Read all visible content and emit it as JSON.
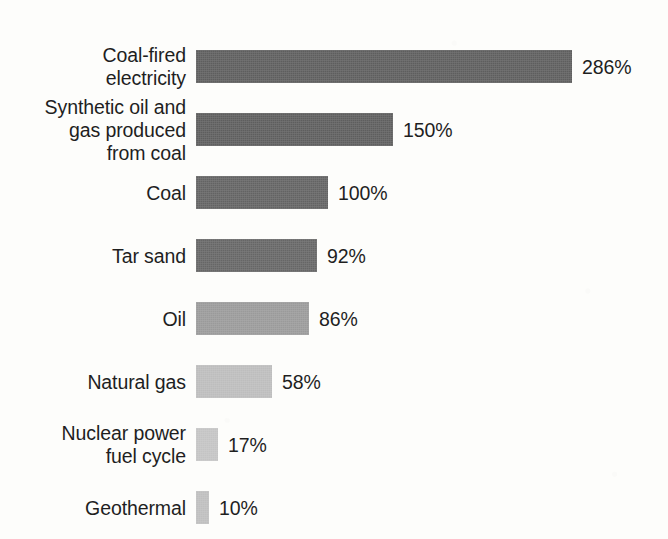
{
  "chart_data": {
    "type": "bar",
    "orientation": "horizontal",
    "title": "",
    "subtitle": "",
    "xlabel": "",
    "ylabel": "",
    "grid": false,
    "legend": false,
    "axes_visible": false,
    "value_unit": "%",
    "value_label_position": "outside-end",
    "categories": [
      "Coal-fired\nelectricity",
      "Synthetic oil and\ngas produced\nfrom coal",
      "Coal",
      "Tar sand",
      "Oil",
      "Natural gas",
      "Nuclear power\nfuel cycle",
      "Geothermal"
    ],
    "values": [
      286,
      150,
      100,
      92,
      86,
      58,
      17,
      10
    ],
    "value_labels": [
      "286%",
      "150%",
      "100%",
      "92%",
      "86%",
      "58%",
      "17%",
      "10%"
    ],
    "bar_colors": [
      "#5e5e5e",
      "#5e5e5e",
      "#636363",
      "#666666",
      "#9a9a9a",
      "#bdbdbd",
      "#c4c4c4",
      "#bfbfbf"
    ],
    "xlim": [
      0,
      286
    ],
    "baseline_value": 0
  },
  "layout": {
    "background": "#fdfdfb",
    "text_color": "#1f1f1f",
    "bar_origin_x": 196,
    "bar_height": 33,
    "row_pitch": 63,
    "first_row_top": 50,
    "px_per_percent": 1.315,
    "value_label_gap": 10
  }
}
